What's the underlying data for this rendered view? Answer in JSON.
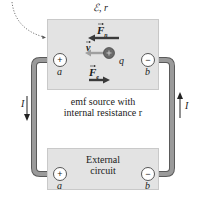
{
  "diagram": {
    "source_box": {
      "emf_label": "ℰ, r",
      "description_line1": "emf source with",
      "description_line2": "internal resistance r",
      "fill": "#e3e3e3"
    },
    "external_box": {
      "label_line1": "External",
      "label_line2": "circuit",
      "fill": "#e3e3e3"
    },
    "terminals": {
      "positive_symbol": "+",
      "negative_symbol": "−",
      "positive_label": "a",
      "negative_label": "b"
    },
    "vectors": {
      "nonelectric_force": "F",
      "nonelectric_force_sub": "n",
      "velocity": "v",
      "electric_force": "F",
      "electric_force_sub": "e",
      "charge": "q"
    },
    "current": {
      "left_label": "I",
      "right_label": "I"
    },
    "colors": {
      "wire": "#8a8a8a",
      "wire_edge": "#5a5a5a",
      "arrow_dark": "#3a3a3a",
      "arrow_light": "#9a9a9a",
      "charge": "#6a6a6a"
    }
  }
}
